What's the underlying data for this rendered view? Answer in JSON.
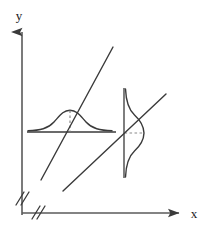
{
  "figure": {
    "title": "",
    "background_color": "#ffffff",
    "stroke_color": "#3a3a3a",
    "dash_color": "#8a8a8a",
    "width": 212,
    "height": 237
  },
  "axes": {
    "x_axis": {
      "label": "x",
      "label_position": {
        "x": 194,
        "y": 218
      },
      "line": {
        "x1": 22,
        "y1": 213,
        "x2": 178,
        "y2": 213
      },
      "arrow": "right-arrowhead",
      "break_mark": "double-slash",
      "break_position": {
        "x": 38,
        "y": 213
      }
    },
    "y_axis": {
      "label": "y",
      "label_position": {
        "x": 19,
        "y": 16
      },
      "line": {
        "x1": 22,
        "y1": 30,
        "x2": 22,
        "y2": 215
      },
      "arrow": "up-arrowhead",
      "break_mark": "double-slash",
      "break_position": {
        "x": 22,
        "y": 200
      }
    }
  },
  "curves": {
    "horizontal_normal_curve": {
      "name": "bell-curve-horizontal",
      "orientation": "horizontal",
      "baseline": {
        "x1": 27,
        "y1": 132,
        "x2": 116,
        "y2": 132
      },
      "peak": {
        "x": 70,
        "y": 110
      },
      "amplitude": 22,
      "spread": 16,
      "dashed_drop_line": {
        "x1": 70,
        "y1": 110,
        "x2": 70,
        "y2": 132
      }
    },
    "vertical_normal_curve": {
      "name": "bell-curve-vertical",
      "orientation": "vertical",
      "baseline": {
        "x1": 124,
        "y1": 88,
        "x2": 124,
        "y2": 178
      },
      "peak": {
        "x": 144,
        "y": 133
      },
      "amplitude": 20,
      "spread": 16,
      "dashed_drop_line": {
        "x1": 124,
        "y1": 133,
        "x2": 144,
        "y2": 133
      }
    }
  },
  "lines": [
    {
      "name": "regression-line-upper",
      "x1": 41,
      "y1": 180,
      "x2": 113,
      "y2": 47,
      "slope": -1.847
    },
    {
      "name": "regression-line-lower",
      "x1": 63,
      "y1": 191,
      "x2": 166,
      "y2": 94,
      "slope": -0.942
    }
  ],
  "legend": {
    "entries": []
  }
}
